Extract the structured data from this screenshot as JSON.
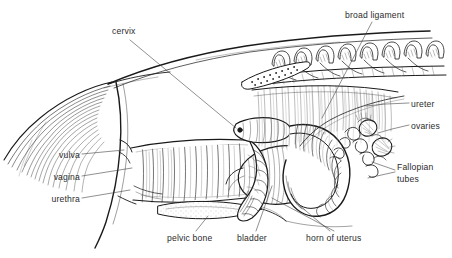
{
  "figure": {
    "background_color": "#ffffff",
    "ink_color": "#1a1a1a",
    "label_color": "#2b2b2b",
    "width": 452,
    "height": 258
  },
  "labels": [
    {
      "id": "cervix",
      "text": "cervix",
      "x": 112,
      "y": 26,
      "align": "left"
    },
    {
      "id": "broad-ligament",
      "text": "broad ligament",
      "x": 345,
      "y": 10,
      "align": "left"
    },
    {
      "id": "ureter",
      "text": "ureter",
      "x": 411,
      "y": 99,
      "align": "left"
    },
    {
      "id": "ovaries",
      "text": "ovaries",
      "x": 411,
      "y": 121,
      "align": "left"
    },
    {
      "id": "vulva",
      "text": "vulva",
      "x": 46,
      "y": 150,
      "align": "right"
    },
    {
      "id": "vagina",
      "text": "vagina",
      "x": 46,
      "y": 172,
      "align": "right"
    },
    {
      "id": "urethra",
      "text": "urethra",
      "x": 46,
      "y": 194,
      "align": "right"
    },
    {
      "id": "fallopian-tubes",
      "text": "Fallopian tubes",
      "x": 397,
      "y": 162,
      "align": "left",
      "wrap": true
    },
    {
      "id": "pelvic-bone",
      "text": "pelvic bone",
      "x": 167,
      "y": 233,
      "align": "left"
    },
    {
      "id": "bladder",
      "text": "bladder",
      "x": 237,
      "y": 233,
      "align": "left"
    },
    {
      "id": "horn-of-uterus",
      "text": "horn of uterus",
      "x": 306,
      "y": 233,
      "align": "left"
    }
  ],
  "anatomy_parts": [
    "cervix",
    "broad ligament",
    "ureter",
    "ovaries",
    "vulva",
    "vagina",
    "urethra",
    "Fallopian tubes",
    "pelvic bone",
    "bladder",
    "horn of uterus"
  ]
}
